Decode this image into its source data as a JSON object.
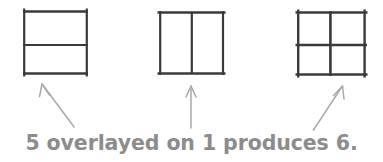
{
  "document": {
    "type": "geometric-figure-diagram",
    "background_color": "#ffffff",
    "title": "5 overlayed on 1 produces 6."
  },
  "caption": {
    "text": "5 overlayed on 1 produces 6.",
    "color": "#8c8c8c",
    "parts": {
      "first_number": "5",
      "middle_phrase": "overlayed on",
      "second_number": "1",
      "verb": "produces",
      "result_number": "6",
      "period": "."
    }
  },
  "figures": [
    {
      "id": "figure-5",
      "label": "5",
      "description": "Square divided by one horizontal middle line",
      "stroke_color": "#3a3a3a",
      "stroke_width": 2.4,
      "bounds": {
        "x": 23,
        "y": 11,
        "width": 65,
        "height": 63
      },
      "interior_lines": [
        {
          "orientation": "horizontal",
          "position": 0.54
        }
      ]
    },
    {
      "id": "figure-1",
      "label": "1",
      "description": "Square divided by one vertical middle line",
      "stroke_color": "#3a3a3a",
      "stroke_width": 2.4,
      "bounds": {
        "x": 159,
        "y": 12,
        "width": 65,
        "height": 62
      },
      "interior_lines": [
        {
          "orientation": "vertical",
          "position": 0.5
        }
      ]
    },
    {
      "id": "figure-6",
      "label": "6",
      "description": "Square divided by one horizontal and one vertical middle line forming a 2x2 grid",
      "stroke_color": "#3a3a3a",
      "stroke_width": 2.6,
      "bounds": {
        "x": 297,
        "y": 12,
        "width": 69,
        "height": 63
      },
      "interior_lines": [
        {
          "orientation": "horizontal",
          "position": 0.52
        },
        {
          "orientation": "vertical",
          "position": 0.48
        }
      ]
    }
  ],
  "arrows": [
    {
      "id": "arrow-to-figure-5",
      "direction": "up-left",
      "color": "#a8a8a8",
      "from": {
        "x": 74,
        "y": 127
      },
      "to": {
        "x": 42,
        "y": 84
      }
    },
    {
      "id": "arrow-to-figure-1",
      "direction": "up",
      "color": "#a8a8a8",
      "from": {
        "x": 191,
        "y": 128
      },
      "to": {
        "x": 191,
        "y": 86
      }
    },
    {
      "id": "arrow-to-figure-6",
      "direction": "up-right",
      "color": "#a8a8a8",
      "from": {
        "x": 314,
        "y": 130
      },
      "to": {
        "x": 342,
        "y": 86
      }
    }
  ]
}
